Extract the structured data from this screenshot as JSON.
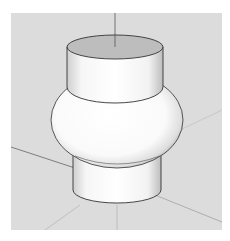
{
  "viewport": {
    "background": "#dcdcdc",
    "model": "revolved-solid-with-bulge",
    "axes": [
      "blue-vertical-axis",
      "red-axis",
      "green-axis"
    ]
  },
  "colors": {
    "top_face": "#bdbdbd",
    "body": "#ffffff",
    "edge": "#333333",
    "axis": "#8a8a8a"
  }
}
